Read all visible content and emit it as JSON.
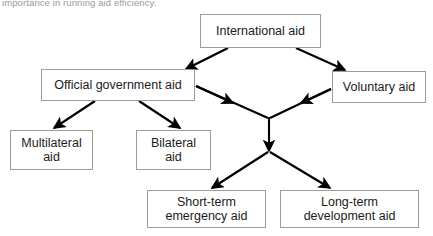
{
  "caption": {
    "text": "importance in running aid efficiency."
  },
  "diagram": {
    "box_border_color": "#9b9b9b",
    "arrow_color": "#000000",
    "background": "#ffffff",
    "nodes": [
      {
        "id": "international-aid",
        "label": "International aid"
      },
      {
        "id": "official-government-aid",
        "label": "Official government aid"
      },
      {
        "id": "voluntary-aid",
        "label": "Voluntary aid"
      },
      {
        "id": "multilateral-aid",
        "label": "Multilateral\naid"
      },
      {
        "id": "bilateral-aid",
        "label": "Bilateral\naid"
      },
      {
        "id": "short-term-emergency-aid",
        "label": "Short-term\nemergency aid"
      },
      {
        "id": "long-term-development-aid",
        "label": "Long-term\ndevelopment aid"
      }
    ],
    "edges": [
      {
        "from": "international-aid",
        "to": "official-government-aid"
      },
      {
        "from": "international-aid",
        "to": "voluntary-aid"
      },
      {
        "from": "official-government-aid",
        "to": "multilateral-aid"
      },
      {
        "from": "official-government-aid",
        "to": "bilateral-aid"
      },
      {
        "from": "official-government-aid",
        "to": "junction"
      },
      {
        "from": "voluntary-aid",
        "to": "junction"
      },
      {
        "from": "junction",
        "to": "split"
      },
      {
        "from": "split",
        "to": "short-term-emergency-aid"
      },
      {
        "from": "split",
        "to": "long-term-development-aid"
      }
    ]
  }
}
